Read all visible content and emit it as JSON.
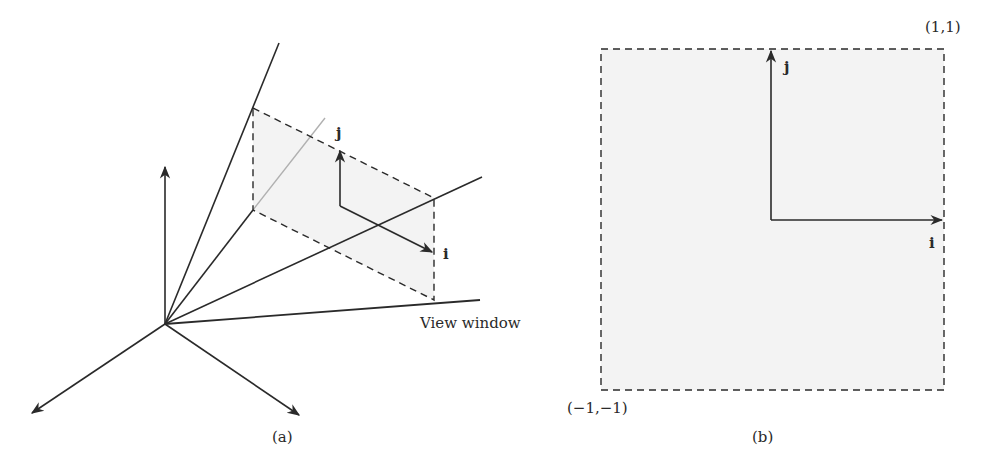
{
  "figure_a": {
    "caption": "(a)",
    "view_window_label": "View window",
    "i_label": "i",
    "j_label": "j"
  },
  "figure_b": {
    "caption": "(b)",
    "top_right_label": "(1,1)",
    "bottom_left_label": "(−1,−1)",
    "i_label": "i",
    "j_label": "j"
  },
  "colors": {
    "stroke": "#2a2a2a",
    "fill": "#f2f2f2",
    "faint_line": "#b0b0b0"
  }
}
